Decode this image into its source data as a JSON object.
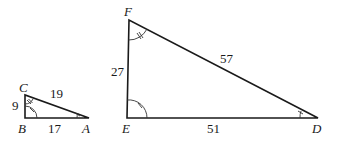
{
  "figure": {
    "small_triangle": {
      "vertices": {
        "A": "A",
        "B": "B",
        "C": "C"
      },
      "sides": {
        "BC": "9",
        "CA": "19",
        "BA": "17"
      },
      "angle_marks": {
        "B": "single arc, single tick",
        "C": "single arc, double tick",
        "A": "single arc, single tick"
      }
    },
    "large_triangle": {
      "vertices": {
        "D": "D",
        "E": "E",
        "F": "F"
      },
      "sides": {
        "EF": "27",
        "FD": "57",
        "ED": "51"
      },
      "angle_marks": {
        "E": "single arc, single tick",
        "F": "single arc, double tick",
        "D": "single arc, single tick"
      }
    }
  }
}
